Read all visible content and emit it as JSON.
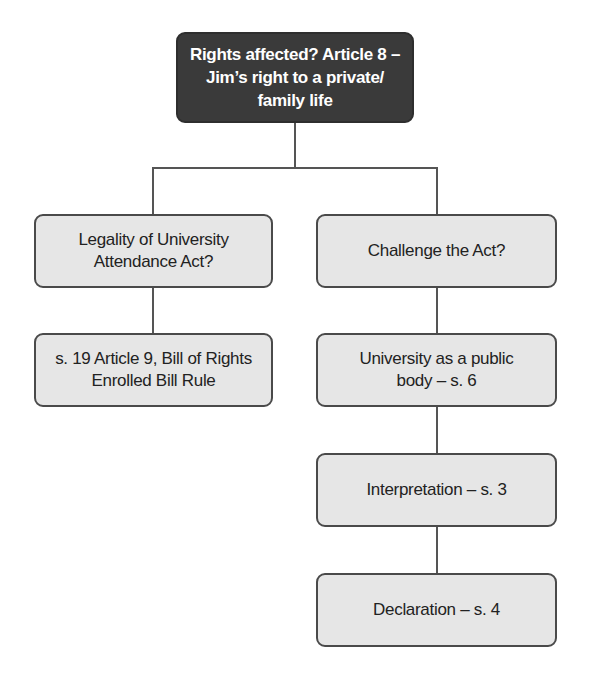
{
  "diagram": {
    "root": {
      "text": "Rights affected? Article 8 –\nJim’s right to a private/\nfamily life"
    },
    "left_branch": [
      {
        "text": "Legality of University\nAttendance Act?"
      },
      {
        "text": "s. 19 Article 9, Bill of Rights\nEnrolled Bill Rule"
      }
    ],
    "right_branch": [
      {
        "text": "Challenge the Act?"
      },
      {
        "text": "University as a public\nbody – s. 6"
      },
      {
        "text": "Interpretation – s. 3"
      },
      {
        "text": "Declaration – s. 4"
      }
    ],
    "colors": {
      "root_fill": "#3a3a3a",
      "node_fill": "#e6e6e6",
      "border": "#4a4a4a",
      "line": "#555555"
    }
  }
}
